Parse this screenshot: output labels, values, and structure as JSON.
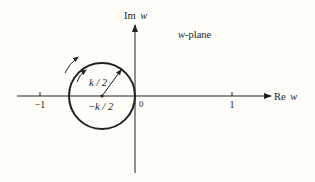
{
  "diagram": {
    "plane_label": "w-plane",
    "plane_label_var": "w",
    "plane_label_suffix": "-plane",
    "axes": {
      "real_label_prefix": "Re",
      "real_label_var": "w",
      "imag_label_prefix": "Im",
      "imag_label_var": "w"
    },
    "ticks": {
      "minus_one": "−1",
      "origin": "0",
      "one": "1"
    },
    "circle": {
      "center_label": "−k / 2",
      "radius_label": "k / 2",
      "direction": "counterclockwise"
    },
    "colors": {
      "background": "#fffef8",
      "ink": "#222222"
    }
  }
}
